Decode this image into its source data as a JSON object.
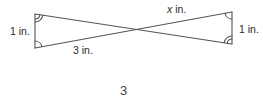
{
  "figure": {
    "labels": {
      "left_side": "1 in.",
      "right_side": "1 in.",
      "top_right_segment_var": "x",
      "top_right_segment_unit": " in.",
      "bottom_left_segment": "3 in."
    },
    "figure_number": "3",
    "colors": {
      "stroke": "#555555",
      "text": "#2a2a2a"
    },
    "angle_marks": {
      "left_top": "double-arc",
      "left_bottom": "single-arc",
      "right_top": "single-arc",
      "right_bottom": "double-arc"
    }
  }
}
